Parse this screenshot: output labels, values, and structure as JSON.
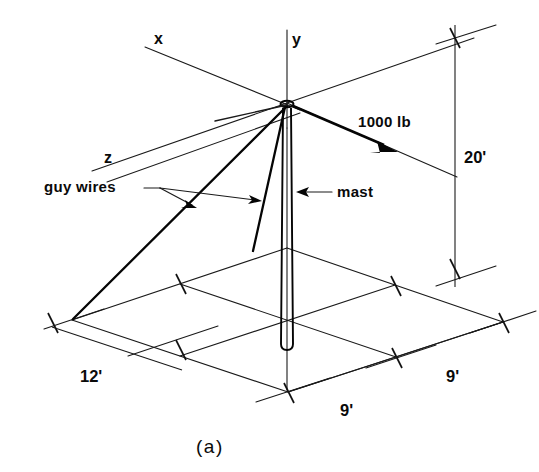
{
  "figure": {
    "caption": "(a)",
    "axes": {
      "x_label": "x",
      "y_label": "y",
      "z_label": "z"
    },
    "annotations": {
      "force_label": "1000 lb",
      "guy_wires_label": "guy wires",
      "mast_label": "mast"
    },
    "dimensions": {
      "height": "20'",
      "left_span": "12'",
      "front_span_1": "9'",
      "front_span_2": "9'"
    },
    "colors": {
      "ink": "#0a0a0a",
      "background": "#ffffff"
    }
  }
}
